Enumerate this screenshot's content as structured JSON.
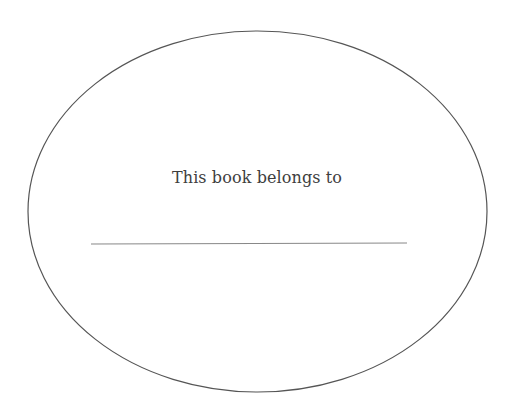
{
  "bookplate": {
    "title": "This book belongs to",
    "name_value": "",
    "colors": {
      "background": "#ffffff",
      "outline": "#555555",
      "line": "#888888",
      "text": "#3e3e3e"
    }
  }
}
